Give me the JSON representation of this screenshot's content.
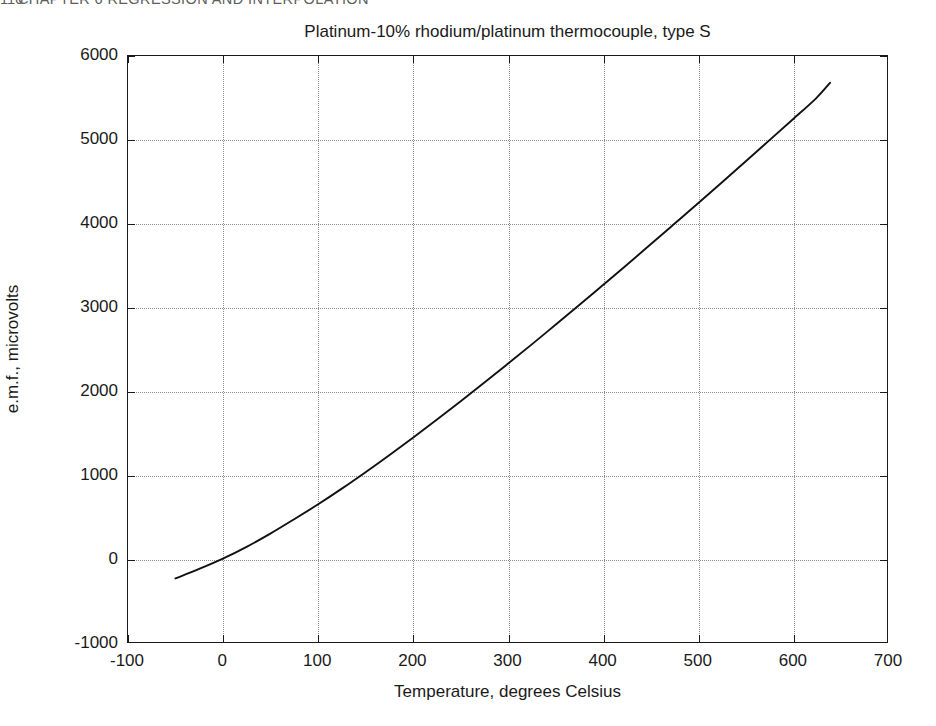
{
  "page_header": {
    "folio": "116",
    "running_head": "CHAPTER 6  REGRESSION AND INTERPOLATION"
  },
  "chart_data": {
    "type": "line",
    "title": "Platinum-10% rhodium/platinum thermocouple, type S",
    "xlabel": "Temperature, degrees Celsius",
    "ylabel": "e.m.f., microvolts",
    "xlim": [
      -100,
      700
    ],
    "ylim": [
      -1000,
      6000
    ],
    "xticks": [
      -100,
      0,
      100,
      200,
      300,
      400,
      500,
      600,
      700
    ],
    "xtick_labels": [
      "-100",
      "0",
      "100",
      "200",
      "300",
      "400",
      "500",
      "600",
      "700"
    ],
    "yticks": [
      -1000,
      0,
      1000,
      2000,
      3000,
      4000,
      5000,
      6000
    ],
    "ytick_labels": [
      "-1000",
      "0",
      "1000",
      "2000",
      "3000",
      "4000",
      "5000",
      "6000"
    ],
    "grid": true,
    "grid_style": "dotted",
    "legend": null,
    "series": [
      {
        "name": "Type S thermocouple e.m.f.",
        "color": "#111111",
        "line_width": 1.9,
        "x": [
          -50,
          -25,
          0,
          25,
          50,
          75,
          100,
          125,
          150,
          175,
          200,
          225,
          250,
          275,
          300,
          325,
          350,
          375,
          400,
          425,
          450,
          475,
          500,
          525,
          550,
          575,
          600,
          625,
          640
        ],
        "y": [
          -236,
          -123,
          0,
          141,
          299,
          470,
          646,
          833,
          1029,
          1232,
          1441,
          1655,
          1874,
          2096,
          2323,
          2552,
          2786,
          3021,
          3260,
          3500,
          3743,
          3988,
          4234,
          4482,
          4732,
          4984,
          5237,
          5492,
          5680
        ]
      }
    ]
  }
}
